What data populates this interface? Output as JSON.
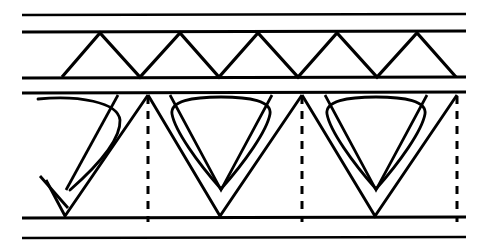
{
  "figure": {
    "background_color": "#ffffff",
    "ink_color": "#000000",
    "width": 495,
    "height": 250
  },
  "chart_data": {
    "type": "diagram",
    "xlabel": "",
    "ylabel": "",
    "xlim": [
      0,
      495
    ],
    "ylim": [
      0,
      250
    ],
    "grid": false,
    "legend": "none",
    "series": [
      {
        "name": "horizontal-rails",
        "kind": "line",
        "stroke_width": 2.6,
        "x_start": 22,
        "x_end": 466,
        "y_values": [
          15,
          32,
          78,
          93,
          218,
          238
        ]
      },
      {
        "name": "upper-zigzag",
        "kind": "polyline",
        "stroke_width": 3.2,
        "top_y": 33,
        "bottom_y": 77,
        "apex_x": [
          100,
          180,
          258,
          337,
          417
        ],
        "valley_x": [
          62,
          140,
          219,
          298,
          377,
          456
        ]
      },
      {
        "name": "lower-vee-elements",
        "kind": "polyline",
        "stroke_width": 2.8,
        "top_y": 95,
        "bottom_y": 216,
        "apex_x": [
          148,
          302,
          457
        ],
        "valley_x": [
          65,
          220,
          375
        ],
        "left_partial_valley_x": 65,
        "left_partial_start_x": 40,
        "left_partial_start_y": 176
      },
      {
        "name": "teardrop-loops",
        "kind": "closed-curve",
        "stroke_width": 2.8,
        "count": 3,
        "tip_x": [
          65,
          220,
          375
        ],
        "tip_y": 188,
        "top_y": 99,
        "half_width_top": 58
      },
      {
        "name": "vertical-dashed-centerlines",
        "kind": "dashed-line",
        "stroke_width": 3.0,
        "dash": "8 7",
        "x_values": [
          148,
          302,
          457
        ],
        "y_start": 96,
        "y_end": 222
      }
    ]
  }
}
